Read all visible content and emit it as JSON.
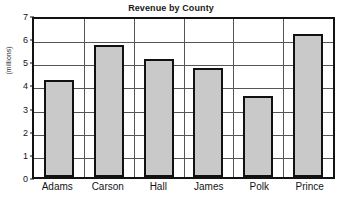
{
  "chart_data": {
    "type": "bar",
    "title": "Revenue by County",
    "xlabel": "",
    "ylabel": "(millions)",
    "categories": [
      "Adams",
      "Carson",
      "Hall",
      "James",
      "Polk",
      "Prince"
    ],
    "values": [
      4.2,
      5.7,
      5.1,
      4.7,
      3.5,
      6.2
    ],
    "ylim": [
      0,
      7
    ],
    "ytick_labels": [
      "0",
      "1",
      "2",
      "3",
      "4",
      "5",
      "6",
      "7"
    ],
    "ytick_values": [
      0,
      1,
      2,
      3,
      4,
      5,
      6,
      7
    ],
    "grid": true,
    "grid_horizontal": true,
    "grid_vertical": true,
    "legend": false,
    "legend_position": "none",
    "colors": {
      "bar_fill": "#c9c9c9",
      "bar_border": "#111111",
      "axis": "#121212",
      "gridline": "#555555",
      "text": "#141414",
      "background": "#ffffff"
    }
  }
}
